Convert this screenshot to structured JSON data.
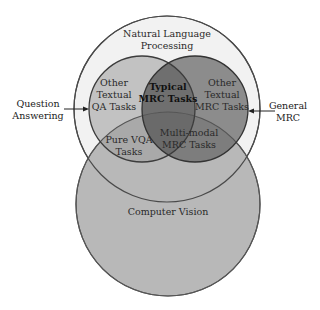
{
  "diagram": {
    "type": "venn",
    "sets": [
      {
        "id": "nlp",
        "label_lines": [
          "Natural Language",
          "Processing"
        ],
        "fill": "#f0f0f0"
      },
      {
        "id": "cv",
        "label_lines": [
          "Computer Vision"
        ],
        "fill": "#b9b9b9"
      },
      {
        "id": "qa",
        "label_lines": [
          "Other",
          "Textual",
          "QA Tasks"
        ],
        "fill": "#bdbdbd"
      },
      {
        "id": "mrc",
        "label_lines": [
          "Other",
          "Textual",
          "MRC Tasks"
        ],
        "fill": "#8a8a8a"
      }
    ],
    "regions": {
      "typical_mrc": {
        "label_lines": [
          "Typical",
          "MRC Tasks"
        ],
        "bold": true
      },
      "pure_vqa": {
        "label_lines": [
          "Pure VQA",
          "Tasks"
        ]
      },
      "multimodal_mrc": {
        "label_lines": [
          "Multi-modal",
          "MRC Tasks"
        ]
      }
    },
    "external_labels": {
      "question_answering": {
        "lines": [
          "Question",
          "Answering"
        ],
        "points_to": "qa"
      },
      "general_mrc": {
        "lines": [
          "General",
          "MRC"
        ],
        "points_to": "mrc"
      }
    },
    "colors": {
      "stroke": "#4a4a4a",
      "background": "#ffffff"
    }
  }
}
